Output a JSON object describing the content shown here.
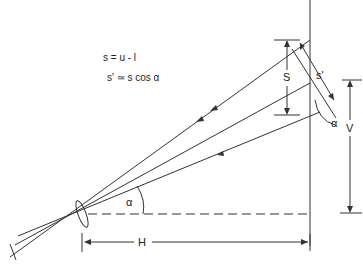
{
  "equations": {
    "line1": "s = u - l",
    "line2": "s' ≃ s cos α"
  },
  "labels": {
    "S": "S",
    "s_prime": "s'",
    "alpha_right": "α",
    "alpha_left": "α",
    "V": "V",
    "H": "H"
  },
  "colors": {
    "ink": "#333333",
    "background": "#ffffff"
  }
}
